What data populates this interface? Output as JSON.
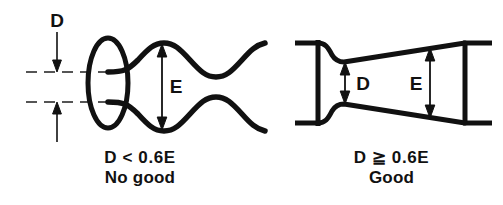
{
  "figure": {
    "background_color": "#ffffff",
    "ink_color": "#111111"
  },
  "panels": [
    {
      "id": "no-good",
      "name": "left-panel",
      "diagram_type": "wavy-coil-with-end-loop",
      "dimensions": [
        {
          "symbol": "D",
          "name": "lead-gap",
          "meaning": "gap between leads"
        },
        {
          "symbol": "E",
          "name": "coil-diameter",
          "meaning": "coil outside diameter"
        }
      ],
      "caption": {
        "condition": "D < 0.6E",
        "verdict": "No good"
      }
    },
    {
      "id": "good",
      "name": "right-panel",
      "diagram_type": "tapered-cone-coil",
      "dimensions": [
        {
          "symbol": "D",
          "name": "lead-gap",
          "meaning": "gap between leads"
        },
        {
          "symbol": "E",
          "name": "coil-diameter",
          "meaning": "coil outside diameter"
        }
      ],
      "caption": {
        "condition": "D ≧ 0.6E",
        "verdict": "Good"
      }
    }
  ],
  "labels": {
    "left_D": "D",
    "left_E": "E",
    "right_D": "D",
    "right_E": "E"
  }
}
